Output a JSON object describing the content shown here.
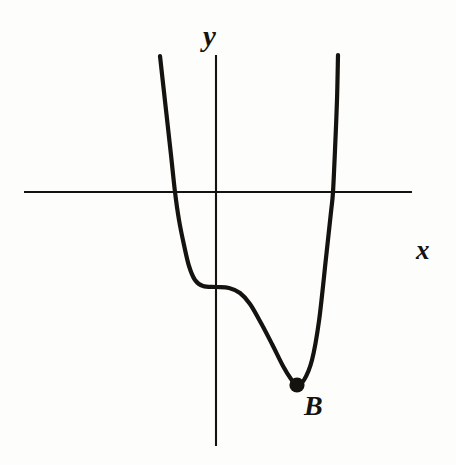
{
  "figure": {
    "kind": "cartesian-graph-sketch",
    "background_color": "#fdfdfc",
    "ink_color": "#15130f",
    "width": 456,
    "height": 465
  },
  "labels": {
    "y_axis": "y",
    "x_axis": "x",
    "point_b": "B"
  },
  "chart_data": {
    "type": "line",
    "title": "",
    "subtitle": "",
    "xlabel": "x",
    "ylabel": "y",
    "grid": false,
    "legend_position": "none",
    "axes": {
      "x_axis_pixel_y": 192,
      "x_axis_pixel_x_start": 24,
      "x_axis_pixel_x_end": 412,
      "y_axis_pixel_x": 216,
      "y_axis_pixel_y_start": 55,
      "y_axis_pixel_y_end": 446,
      "origin_pixel": [
        216,
        192
      ],
      "x_tick_labels": [],
      "y_tick_labels": []
    },
    "series": [
      {
        "name": "curve",
        "description": "quartic-like curve with a saddle/plateau on the y-axis and a local minimum at B",
        "points_pixel": [
          [
            160,
            56
          ],
          [
            166,
            110
          ],
          [
            171,
            155
          ],
          [
            175,
            192
          ],
          [
            179,
            220
          ],
          [
            184,
            245
          ],
          [
            189,
            266
          ],
          [
            195,
            280
          ],
          [
            203,
            286
          ],
          [
            216,
            287
          ],
          [
            229,
            288
          ],
          [
            240,
            293
          ],
          [
            250,
            304
          ],
          [
            261,
            323
          ],
          [
            272,
            344
          ],
          [
            283,
            366
          ],
          [
            291,
            379
          ],
          [
            297,
            385
          ],
          [
            304,
            380
          ],
          [
            312,
            360
          ],
          [
            319,
            321
          ],
          [
            326,
            258
          ],
          [
            331,
            212
          ],
          [
            333,
            192
          ],
          [
            335,
            150
          ],
          [
            337,
            100
          ],
          [
            338,
            55
          ]
        ]
      }
    ],
    "annotations": [
      {
        "label": "B",
        "kind": "local-minimum-point",
        "marker": "filled-dot",
        "point_pixel": [
          297,
          385
        ],
        "label_pixel": [
          314,
          408
        ]
      }
    ],
    "x_axis_crossings_pixel": [
      175,
      333
    ],
    "y_axis_crossing_pixel": [
      216,
      287
    ]
  }
}
